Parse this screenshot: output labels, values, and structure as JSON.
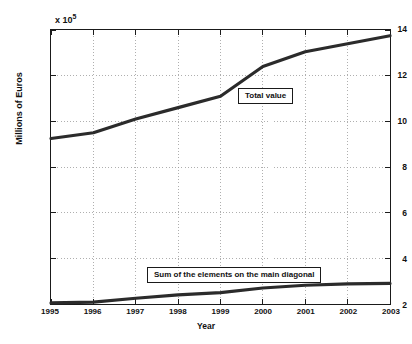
{
  "axes": {
    "y_exponent_prefix": "x 10",
    "y_exponent_power": "5",
    "y_axis_title": "Millions of Euros",
    "x_axis_title": "Year",
    "y_ticks": [
      "2",
      "4",
      "6",
      "8",
      "10",
      "12",
      "14"
    ],
    "x_ticks": [
      "1995",
      "1996",
      "1997",
      "1998",
      "1999",
      "2000",
      "2001",
      "2002",
      "2003"
    ]
  },
  "annotations": {
    "total_value": "Total value",
    "main_diagonal": "Sum of the elements on the main diagonal"
  },
  "colors": {
    "line": "#2b2b2b",
    "axis": "#1a1a1a",
    "grid": "#9a9a9a",
    "background": "#ffffff"
  },
  "chart_data": {
    "type": "line",
    "title": "",
    "xlabel": "Year",
    "ylabel": "Millions of Euros",
    "y_scale_factor": 100000,
    "y_scale_label": "x 10^5",
    "xlim": [
      1995,
      2003
    ],
    "ylim": [
      2,
      14
    ],
    "grid": true,
    "legend": "none",
    "x": [
      1995,
      1996,
      1997,
      1998,
      1999,
      2000,
      2001,
      2002,
      2003
    ],
    "series": [
      {
        "name": "Total value",
        "values": [
          9.25,
          9.5,
          10.1,
          10.6,
          11.1,
          12.4,
          13.05,
          13.4,
          13.75
        ]
      },
      {
        "name": "Sum of the elements on the main diagonal",
        "values": [
          2.05,
          2.08,
          2.25,
          2.4,
          2.5,
          2.7,
          2.82,
          2.88,
          2.9
        ]
      }
    ]
  }
}
